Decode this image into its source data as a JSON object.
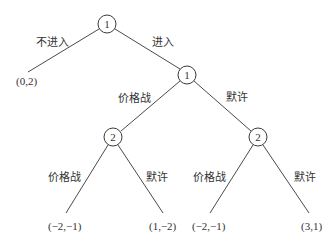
{
  "diagram": {
    "type": "game-tree",
    "colors": {
      "line": "#4a4a4a",
      "text": "#333333",
      "background": "#ffffff"
    },
    "nodes": [
      {
        "id": "root",
        "player": "1",
        "x": 107,
        "y": 24
      },
      {
        "id": "n1",
        "player": "1",
        "x": 187,
        "y": 75
      },
      {
        "id": "n2a",
        "player": "2",
        "x": 113,
        "y": 137
      },
      {
        "id": "n2b",
        "player": "2",
        "x": 258,
        "y": 137
      }
    ],
    "edges": [
      {
        "from": "root",
        "to": "leaf0",
        "label": "不进入"
      },
      {
        "from": "root",
        "to": "n1",
        "label": "进入"
      },
      {
        "from": "n1",
        "to": "n2a",
        "label": "价格战"
      },
      {
        "from": "n1",
        "to": "n2b",
        "label": "默许"
      },
      {
        "from": "n2a",
        "to": "leaf1",
        "label": "价格战"
      },
      {
        "from": "n2a",
        "to": "leaf2",
        "label": "默许"
      },
      {
        "from": "n2b",
        "to": "leaf3",
        "label": "价格战"
      },
      {
        "from": "n2b",
        "to": "leaf4",
        "label": "默许"
      }
    ],
    "leaves": [
      {
        "id": "leaf0",
        "payoff": "(0,2)"
      },
      {
        "id": "leaf1",
        "payoff": "(−2,−1)"
      },
      {
        "id": "leaf2",
        "payoff": "(1,−2)"
      },
      {
        "id": "leaf3",
        "payoff": "(−2,−1)"
      },
      {
        "id": "leaf4",
        "payoff": "(3,1)"
      }
    ]
  }
}
